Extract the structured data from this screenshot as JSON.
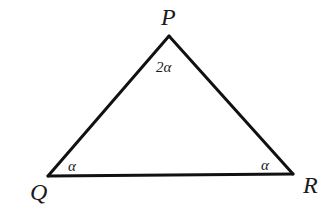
{
  "diagram": {
    "type": "triangle",
    "stroke_color": "#111111",
    "background": "#ffffff",
    "vertices": [
      {
        "id": "P",
        "label": "P",
        "x": 169,
        "y": 36
      },
      {
        "id": "Q",
        "label": "Q",
        "x": 48,
        "y": 176
      },
      {
        "id": "R",
        "label": "R",
        "x": 293,
        "y": 174
      }
    ],
    "edges": [
      {
        "from": "P",
        "to": "Q"
      },
      {
        "from": "Q",
        "to": "R"
      },
      {
        "from": "R",
        "to": "P"
      }
    ],
    "angles": [
      {
        "vertex": "P",
        "label": "2α"
      },
      {
        "vertex": "Q",
        "label": "α"
      },
      {
        "vertex": "R",
        "label": "α"
      }
    ]
  }
}
